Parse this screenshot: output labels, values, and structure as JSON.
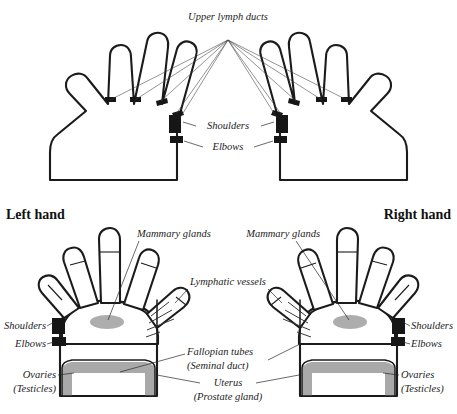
{
  "document": {
    "type": "reflexology-diagram",
    "subject": "Hand reflexology chart: lymphatic system and reproductive organ zones"
  },
  "upper_panel": {
    "name": "upper-lymph-ducts-panel",
    "title": "Upper lymph ducts",
    "labels": {
      "shoulders": "Shoulders",
      "elbows": "Elbows"
    }
  },
  "lower_panel": {
    "name": "lower-hands-panel",
    "left_hand_title": "Left hand",
    "right_hand_title": "Right hand",
    "labels": {
      "mammary_left": "Mammary glands",
      "mammary_right": "Mammary glands",
      "lymphatic_vessels": "Lymphatic vessels",
      "shoulders_left": "Shoulders",
      "elbows_left": "Elbows",
      "shoulders_right": "Shoulders",
      "elbows_right": "Elbows",
      "ovaries_left_line1": "Ovaries",
      "ovaries_left_line2": "(Testicles)",
      "ovaries_right_line1": "Ovaries",
      "ovaries_right_line2": "(Testicles)",
      "fallopian_line1": "Fallopian tubes",
      "fallopian_line2": "(Seminal duct)",
      "uterus_line1": "Uterus",
      "uterus_line2": "(Prostate gland)"
    }
  },
  "colors": {
    "ink": "#1b1b1b",
    "shade_gray": "#a9a9a9",
    "gray_edge": "#9d9d9d",
    "background": "#ffffff",
    "duct_line": "#3a3a3a"
  }
}
